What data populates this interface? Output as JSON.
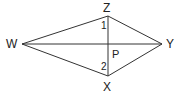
{
  "diagram": {
    "type": "kite",
    "points": {
      "W": {
        "label": "W",
        "x": 22,
        "y": 44
      },
      "Z": {
        "label": "Z",
        "x": 108,
        "y": 16
      },
      "Y": {
        "label": "Y",
        "x": 162,
        "y": 44
      },
      "X": {
        "label": "X",
        "x": 108,
        "y": 76
      },
      "P": {
        "label": "P",
        "x": 108,
        "y": 44
      }
    },
    "segments": [
      "WZ",
      "ZY",
      "YX",
      "XW",
      "WY",
      "ZX"
    ],
    "angles": {
      "angle1": {
        "label": "1"
      },
      "angle2": {
        "label": "2"
      }
    }
  }
}
